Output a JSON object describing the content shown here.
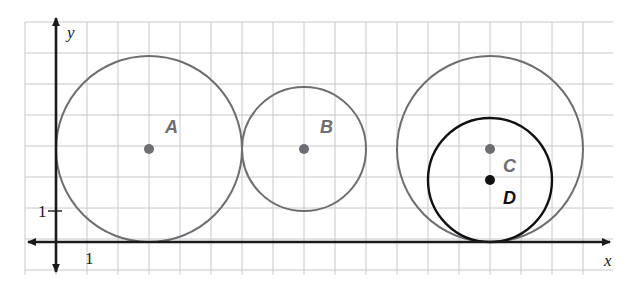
{
  "figure": {
    "type": "geometry-diagram",
    "background_color": "#ffffff",
    "grid": {
      "line_color": "#c8c8cc",
      "unit_pixels": 31,
      "left_px": 25,
      "top_px": 22,
      "right_px": 613,
      "bottom_px": 275,
      "origin_px": {
        "x": 56,
        "y": 242
      },
      "columns": 19,
      "rows": 8
    },
    "axes": {
      "color": "#1a1a1a",
      "x_axis": {
        "label": "x",
        "label_px": {
          "x": 604,
          "y": 266
        },
        "start_px": {
          "x": 28,
          "y": 242
        },
        "end_px": {
          "x": 610,
          "y": 242
        },
        "arrow_start": true,
        "arrow_end": true,
        "tick_label": "1",
        "tick_label_px": {
          "x": 85,
          "y": 264
        }
      },
      "y_axis": {
        "label": "y",
        "label_px": {
          "x": 67,
          "y": 38
        },
        "start_px": {
          "x": 56,
          "y": 18
        },
        "end_px": {
          "x": 56,
          "y": 272
        },
        "arrow_start": true,
        "arrow_end": true,
        "tick_label": "1",
        "tick_label_px": {
          "x": 38,
          "y": 217
        },
        "tick_mark_px": {
          "x": 56,
          "y": 211
        }
      }
    },
    "colors": {
      "gray_stroke": "#6e6e72",
      "black_stroke": "#111111",
      "grid": "#c8c8cc",
      "axis": "#1a1a1a"
    },
    "circles": [
      {
        "name": "A",
        "label": "A",
        "color": "#6e6e72",
        "stroke_width": 2,
        "center_units": {
          "x": 3,
          "y": 3
        },
        "radius_units": 3,
        "center_px": {
          "x": 149,
          "y": 149
        },
        "radius_px": 93,
        "label_px": {
          "x": 165,
          "y": 133
        },
        "dot_radius_px": 5,
        "tangent_to_x_axis": true
      },
      {
        "name": "B",
        "label": "B",
        "color": "#6e6e72",
        "stroke_width": 2,
        "center_units": {
          "x": 8,
          "y": 3
        },
        "radius_units": 2,
        "center_px": {
          "x": 304,
          "y": 149
        },
        "radius_px": 62,
        "label_px": {
          "x": 320,
          "y": 133
        },
        "dot_radius_px": 5,
        "tangent_to_x_axis": false
      },
      {
        "name": "C",
        "label": "C",
        "color": "#6e6e72",
        "stroke_width": 2,
        "center_units": {
          "x": 14,
          "y": 3
        },
        "radius_units": 3,
        "center_px": {
          "x": 490,
          "y": 149
        },
        "radius_px": 93,
        "label_px": {
          "x": 503,
          "y": 172
        },
        "dot_radius_px": 5,
        "tangent_to_x_axis": true
      },
      {
        "name": "D",
        "label": "D",
        "color": "#111111",
        "stroke_width": 2.4,
        "center_units": {
          "x": 14,
          "y": 2
        },
        "radius_units": 2,
        "center_px": {
          "x": 490,
          "y": 180
        },
        "radius_px": 62,
        "label_px": {
          "x": 503,
          "y": 204
        },
        "dot_radius_px": 5,
        "tangent_to_x_axis": true
      }
    ]
  }
}
